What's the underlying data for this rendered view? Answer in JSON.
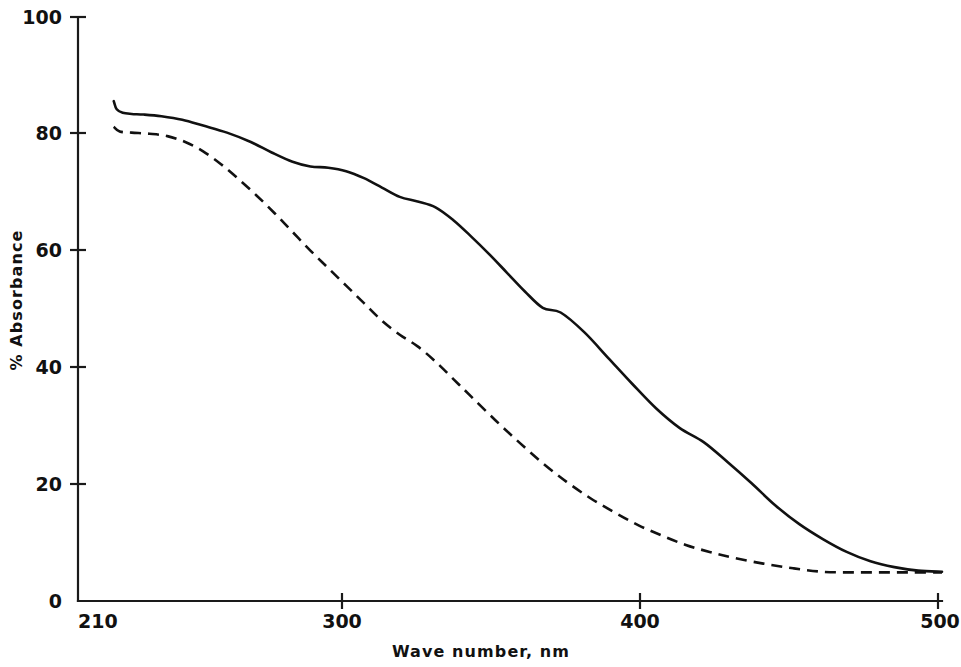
{
  "chart_data": {
    "type": "line",
    "title": "",
    "xlabel": "Wave number, nm",
    "ylabel": "% Absorbance",
    "xlim": [
      210,
      500
    ],
    "ylim": [
      0,
      100
    ],
    "xticks": [
      210,
      300,
      400,
      500
    ],
    "xtick_labels": [
      "210",
      "300",
      "400",
      "500"
    ],
    "yticks": [
      0,
      20,
      40,
      60,
      80,
      100
    ],
    "ytick_labels": [
      "0",
      "20",
      "40",
      "60",
      "80",
      "100"
    ],
    "grid": false,
    "legend": "none",
    "series": [
      {
        "name": "solid-curve",
        "style": "solid",
        "color": "#111111",
        "x": [
          222,
          223,
          225,
          228,
          232,
          238,
          245,
          252,
          260,
          268,
          275,
          282,
          288,
          294,
          300,
          306,
          312,
          318,
          324,
          330,
          336,
          342,
          348,
          354,
          360,
          366,
          372,
          380,
          388,
          396,
          404,
          412,
          420,
          428,
          436,
          444,
          452,
          460,
          468,
          476,
          484,
          492,
          500
        ],
        "y": [
          85.6,
          84.2,
          83.6,
          83.4,
          83.3,
          83.0,
          82.4,
          81.4,
          80.2,
          78.6,
          76.8,
          75.2,
          74.4,
          74.2,
          73.6,
          72.4,
          70.8,
          69.2,
          68.4,
          67.4,
          65.2,
          62.4,
          59.4,
          56.2,
          53.0,
          50.2,
          49.4,
          46.0,
          41.6,
          37.2,
          33.0,
          29.6,
          27.2,
          23.8,
          20.2,
          16.4,
          13.2,
          10.6,
          8.4,
          6.8,
          5.8,
          5.2,
          5.0
        ]
      },
      {
        "name": "dashed-curve",
        "style": "dashed",
        "color": "#111111",
        "x": [
          222,
          224,
          228,
          234,
          240,
          246,
          252,
          258,
          264,
          270,
          276,
          282,
          288,
          294,
          300,
          306,
          312,
          318,
          324,
          330,
          336,
          342,
          350,
          358,
          366,
          374,
          382,
          390,
          398,
          406,
          414,
          422,
          430,
          440,
          450,
          460,
          470,
          480,
          490,
          500
        ],
        "y": [
          81.2,
          80.4,
          80.2,
          80.0,
          79.6,
          78.6,
          77.0,
          74.8,
          72.2,
          69.4,
          66.4,
          63.2,
          60.0,
          57.0,
          54.0,
          51.0,
          48.0,
          45.6,
          43.6,
          41.0,
          38.0,
          35.0,
          31.0,
          27.2,
          23.6,
          20.4,
          17.6,
          15.2,
          13.0,
          11.2,
          9.6,
          8.4,
          7.4,
          6.4,
          5.6,
          5.0,
          4.9,
          4.9,
          4.9,
          4.9
        ]
      }
    ]
  },
  "axes": {
    "x_title": "Wave number, nm",
    "y_title": "% Absorbance"
  }
}
